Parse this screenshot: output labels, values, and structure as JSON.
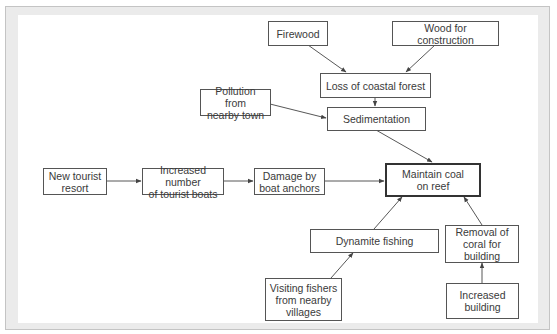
{
  "diagram": {
    "type": "flowchart",
    "direction": "converging on central outcome",
    "colors": {
      "frame": "#ebebeb",
      "frame_border": "#c4c4c4",
      "box_border": "#555555",
      "text": "#3a3a3a",
      "arrow": "#444444"
    },
    "nodes": {
      "firewood": "Firewood",
      "wood_construction": "Wood for construction",
      "loss_forest": "Loss of coastal forest",
      "pollution": "Pollution from\nnearby town",
      "sedimentation": "Sedimentation",
      "tourist_resort": "New tourist\nresort",
      "tourist_boats": "Increased number\nof tourist boats",
      "boat_anchors": "Damage by\nboat anchors",
      "maintain_coral": "Maintain coal\non reef",
      "dynamite": "Dynamite fishing",
      "removal_coral": "Removal of\ncoral for\nbuilding",
      "visiting_fishers": "Visiting fishers\nfrom nearby\nvillages",
      "increased_building": "Increased\nbuilding"
    },
    "edges": [
      {
        "from": "Firewood",
        "to": "Loss of coastal forest"
      },
      {
        "from": "Wood for construction",
        "to": "Loss of coastal forest"
      },
      {
        "from": "Loss of coastal forest",
        "to": "Sedimentation"
      },
      {
        "from": "Pollution from nearby town",
        "to": "Sedimentation"
      },
      {
        "from": "Sedimentation",
        "to": "Maintain coal on reef"
      },
      {
        "from": "New tourist resort",
        "to": "Increased number of tourist boats"
      },
      {
        "from": "Increased number of tourist boats",
        "to": "Damage by boat anchors"
      },
      {
        "from": "Damage by boat anchors",
        "to": "Maintain coal on reef"
      },
      {
        "from": "Dynamite fishing",
        "to": "Maintain coal on reef"
      },
      {
        "from": "Visiting fishers from nearby villages",
        "to": "Dynamite fishing"
      },
      {
        "from": "Removal of coral for building",
        "to": "Maintain coal on reef"
      },
      {
        "from": "Increased building",
        "to": "Removal of coral for building"
      }
    ]
  }
}
